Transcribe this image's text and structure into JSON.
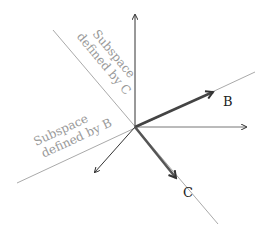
{
  "diagram": {
    "type": "vector-subspace-diagram",
    "origin": [
      135,
      127
    ],
    "axes": [
      {
        "name": "y-axis",
        "to": [
          135,
          15
        ]
      },
      {
        "name": "x-axis",
        "to": [
          246,
          127
        ]
      },
      {
        "name": "z-axis",
        "to": [
          95,
          172
        ]
      }
    ],
    "subspace_lines": [
      {
        "name": "subspace-c-line",
        "from": [
          53,
          30
        ],
        "to": [
          218,
          224
        ],
        "color": "#aaaaaa"
      },
      {
        "name": "subspace-b-line",
        "from": [
          17,
          183
        ],
        "to": [
          255,
          72
        ],
        "color": "#aaaaaa"
      }
    ],
    "vectors": [
      {
        "name": "vector-b",
        "label": "B",
        "to": [
          213,
          92
        ],
        "color": "#444444"
      },
      {
        "name": "vector-c",
        "label": "C",
        "to": [
          176,
          178
        ],
        "color": "#555555"
      }
    ],
    "labels": {
      "subspace_c_line1": "Subspace",
      "subspace_c_line2": "defined by C",
      "subspace_b_line1": "Subspace",
      "subspace_b_line2": "defined by B",
      "vector_b": "B",
      "vector_c": "C"
    },
    "colors": {
      "axis": "#333333",
      "subspace_text": "#999999",
      "vector_label": "#222222"
    }
  }
}
